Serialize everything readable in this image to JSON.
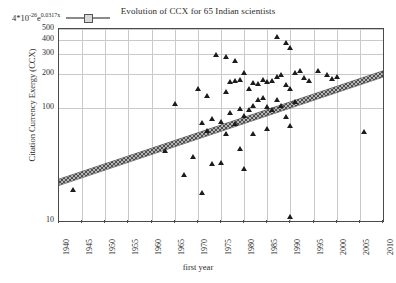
{
  "chart_data": {
    "type": "scatter",
    "title": "Evolution of CCX for 65 Indian scientists",
    "xlabel": "first year",
    "ylabel": "Citation Currency Exergy (CCX)",
    "yscale": "log",
    "ylim": [
      10,
      500
    ],
    "xlim": [
      1940,
      2010
    ],
    "grid": true,
    "legend_position": "top-left",
    "ytick_labels": [
      "500",
      "400",
      "300",
      "200",
      "100",
      "10"
    ],
    "ytick_values": [
      500,
      400,
      300,
      200,
      100,
      10
    ],
    "xtick_labels": [
      "1940",
      "1945",
      "1950",
      "1955",
      "1960",
      "1965",
      "1970",
      "1975",
      "1980",
      "1985",
      "1990",
      "1995",
      "2000",
      "2005",
      "2010"
    ],
    "xtick_values": [
      1940,
      1945,
      1950,
      1955,
      1960,
      1965,
      1970,
      1975,
      1980,
      1985,
      1990,
      1995,
      2000,
      2005,
      2010
    ],
    "series": [
      {
        "name": "scientists",
        "marker": "triangle",
        "color": "#1c1c1c",
        "points": [
          [
            1943,
            19
          ],
          [
            1963,
            42
          ],
          [
            1965,
            110
          ],
          [
            1967,
            26
          ],
          [
            1969,
            37
          ],
          [
            1970,
            150
          ],
          [
            1971,
            75
          ],
          [
            1971,
            18
          ],
          [
            1972,
            130
          ],
          [
            1972,
            63
          ],
          [
            1973,
            80
          ],
          [
            1973,
            32
          ],
          [
            1974,
            295
          ],
          [
            1975,
            76
          ],
          [
            1975,
            33
          ],
          [
            1976,
            285
          ],
          [
            1976,
            140
          ],
          [
            1976,
            59
          ],
          [
            1977,
            170
          ],
          [
            1977,
            92
          ],
          [
            1978,
            265
          ],
          [
            1978,
            175
          ],
          [
            1978,
            73
          ],
          [
            1979,
            178
          ],
          [
            1979,
            98
          ],
          [
            1979,
            44
          ],
          [
            1980,
            205
          ],
          [
            1980,
            85
          ],
          [
            1980,
            29
          ],
          [
            1981,
            150
          ],
          [
            1981,
            96
          ],
          [
            1982,
            168
          ],
          [
            1982,
            106
          ],
          [
            1982,
            60
          ],
          [
            1983,
            165
          ],
          [
            1983,
            120
          ],
          [
            1984,
            180
          ],
          [
            1984,
            125
          ],
          [
            1985,
            170
          ],
          [
            1985,
            104
          ],
          [
            1985,
            66
          ],
          [
            1986,
            175
          ],
          [
            1986,
            96
          ],
          [
            1987,
            430
          ],
          [
            1987,
            190
          ],
          [
            1987,
            118
          ],
          [
            1988,
            197
          ],
          [
            1988,
            105
          ],
          [
            1989,
            380
          ],
          [
            1989,
            160
          ],
          [
            1989,
            84
          ],
          [
            1990,
            340
          ],
          [
            1990,
            150
          ],
          [
            1990,
            70
          ],
          [
            1990,
            11
          ],
          [
            1991,
            205
          ],
          [
            1991,
            113
          ],
          [
            1992,
            215
          ],
          [
            1993,
            185
          ],
          [
            1994,
            175
          ],
          [
            1996,
            215
          ],
          [
            1998,
            196
          ],
          [
            1999,
            182
          ],
          [
            2000,
            190
          ],
          [
            2006,
            62
          ]
        ]
      }
    ],
    "trendline": {
      "label": "4*10^-26 e^0.0317x",
      "formula_mantissa": "4*10",
      "formula_exp1": "-26",
      "formula_base": "e",
      "formula_exp2": "0.0317x",
      "style": "hatched-band",
      "color": "#909090",
      "x_start": 1940,
      "y_start": 22,
      "x_end": 2010,
      "y_end": 200
    }
  }
}
